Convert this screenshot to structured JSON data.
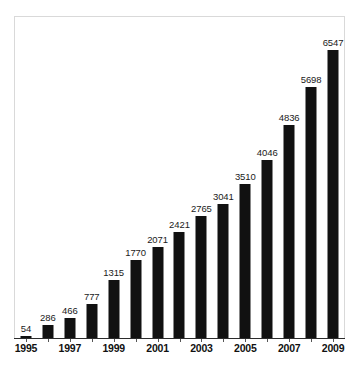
{
  "figure": {
    "background_color": "#ffffff",
    "frame_color": "#d9d9d9",
    "bar_color": "#111111",
    "axis_color": "#2b2b2b",
    "caption_partial": "                                                                                                              "
  },
  "chart_data": {
    "type": "bar",
    "title": "",
    "subtitle": "",
    "xlabel": "",
    "ylabel": "",
    "grid": false,
    "legend": false,
    "legend_position": "none",
    "orientation": "vertical",
    "bar_color": "#111111",
    "data_labels": true,
    "categories": [
      "1995",
      "1996",
      "1997",
      "1998",
      "1999",
      "11900",
      "2001",
      "2002",
      "2003",
      "2004",
      "2005",
      "2006",
      "2007",
      "2008",
      "2009"
    ],
    "x": [
      1995,
      1996,
      1997,
      1998,
      1999,
      2000,
      2001,
      2002,
      2003,
      2004,
      2005,
      2006,
      2007,
      2008,
      2009
    ],
    "values": [
      54,
      286,
      466,
      777,
      1315,
      1770,
      2071,
      2421,
      2765,
      3041,
      3510,
      4046,
      4836,
      5698,
      6547
    ],
    "value_labels": [
      "54",
      "286",
      "466",
      "777",
      "1315",
      "1770",
      "2071",
      "2421",
      "2765",
      "3041",
      "3510",
      "4046",
      "4836",
      "5698",
      "6547"
    ],
    "ylim": [
      0,
      7300
    ],
    "xtick_labels": [
      "1995",
      "1997",
      "1999",
      "2001",
      "2003",
      "2005",
      "2007",
      "2009"
    ],
    "xtick_values": [
      1995,
      1997,
      1999,
      2001,
      2003,
      2005,
      2007,
      2009
    ],
    "ytick_labels": [],
    "tick_years": [
      1995,
      1996,
      1997,
      1998,
      1999,
      2000,
      2001,
      2002,
      2003,
      2004,
      2005,
      2006,
      2007,
      2008,
      2009
    ]
  }
}
